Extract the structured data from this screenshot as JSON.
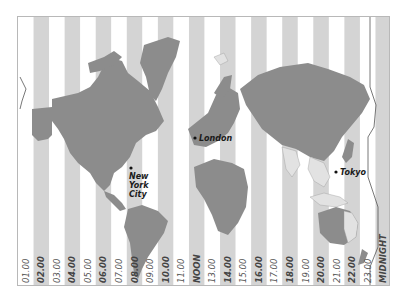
{
  "map": {
    "title": "World Time Zones",
    "colors": {
      "stripe_light": "#ffffff",
      "stripe_dark": "#d4d4d4",
      "land": "#8c8c8c",
      "land_light": "#e2e2e2",
      "dateline": "#555555",
      "frame": "#b8b8b8",
      "city_dot": "#111111"
    },
    "time_zones": [
      {
        "label": "01.00"
      },
      {
        "label": "02.00"
      },
      {
        "label": "03.00"
      },
      {
        "label": "04.00"
      },
      {
        "label": "05.00"
      },
      {
        "label": "06.00"
      },
      {
        "label": "07.00"
      },
      {
        "label": "08.00"
      },
      {
        "label": "09.00"
      },
      {
        "label": "10.00"
      },
      {
        "label": "11.00"
      },
      {
        "label": "NOON"
      },
      {
        "label": "13.00"
      },
      {
        "label": "14.00"
      },
      {
        "label": "15.00"
      },
      {
        "label": "16.00"
      },
      {
        "label": "17.00"
      },
      {
        "label": "18.00"
      },
      {
        "label": "19.00"
      },
      {
        "label": "20.00"
      },
      {
        "label": "21.00"
      },
      {
        "label": "22.00"
      },
      {
        "label": "23.00"
      },
      {
        "label": "MIDNIGHT"
      }
    ],
    "cities": [
      {
        "name": "New York City",
        "lines": [
          "New",
          "York",
          "City"
        ]
      },
      {
        "name": "London",
        "lines": [
          "London"
        ]
      },
      {
        "name": "Tokyo",
        "lines": [
          "Tokyo"
        ]
      }
    ]
  }
}
